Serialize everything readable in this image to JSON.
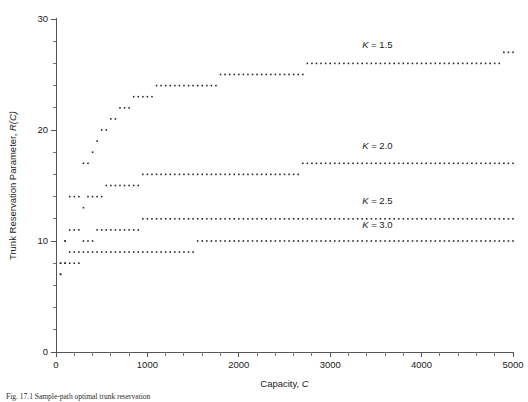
{
  "figure": {
    "caption": "Fig. 17.1  Sample-path optimal trunk reservation",
    "background": "#ffffff",
    "point_color": "#2a2a2a",
    "axis_color": "#555555"
  },
  "chart_data": {
    "type": "scatter",
    "title": "",
    "xlabel": "Capacity, C",
    "xlabel_plain": "Capacity,",
    "xlabel_italic": "C",
    "ylabel": "Trunk Reservation Parameter, R(C)",
    "ylabel_plain": "Trunk Reservation Parameter,",
    "ylabel_italic": "R(C)",
    "xlim": [
      0,
      5000
    ],
    "ylim": [
      0,
      30
    ],
    "x_major_ticks": [
      0,
      1000,
      2000,
      3000,
      4000,
      5000
    ],
    "x_major_tick_labels": [
      "0",
      "1000",
      "2000",
      "3000",
      "4000",
      "5000"
    ],
    "x_minor_step": 200,
    "y_major_ticks": [
      0,
      10,
      20,
      30
    ],
    "y_major_tick_labels": [
      "0",
      "10",
      "20",
      "30"
    ],
    "y_minor_step": 2,
    "grid": false,
    "legend_position": "inline-annotations",
    "series": [
      {
        "name": "K = 1.5",
        "label_plain": "K",
        "label_rest": " = 1.5",
        "annotation_x": 3350,
        "annotation_y": 27.4,
        "x": [
          50,
          100,
          150,
          200,
          250,
          300,
          350,
          400,
          450,
          500,
          550,
          600,
          650,
          700,
          750,
          800,
          850,
          900,
          950,
          1000,
          1050,
          1100,
          1150,
          1200,
          1250,
          1300,
          1350,
          1400,
          1450,
          1500,
          1550,
          1600,
          1650,
          1700,
          1750,
          1800,
          1850,
          1900,
          1950,
          2000,
          2050,
          2100,
          2150,
          2200,
          2250,
          2300,
          2350,
          2400,
          2450,
          2500,
          2550,
          2600,
          2650,
          2700,
          2750,
          2800,
          2850,
          2900,
          2950,
          3000,
          3050,
          3100,
          3150,
          3200,
          3250,
          3300,
          3350,
          3400,
          3450,
          3500,
          3550,
          3600,
          3650,
          3700,
          3750,
          3800,
          3850,
          3900,
          3950,
          4000,
          4050,
          4100,
          4150,
          4200,
          4250,
          4300,
          4350,
          4400,
          4450,
          4500,
          4550,
          4600,
          4650,
          4700,
          4750,
          4800,
          4850,
          4900,
          4950,
          5000
        ],
        "y": [
          7,
          10,
          14,
          14,
          14,
          17,
          17,
          18,
          19,
          20,
          20,
          21,
          21,
          22,
          22,
          22,
          23,
          23,
          23,
          23,
          23,
          24,
          24,
          24,
          24,
          24,
          24,
          24,
          24,
          24,
          24,
          24,
          24,
          24,
          24,
          25,
          25,
          25,
          25,
          25,
          25,
          25,
          25,
          25,
          25,
          25,
          25,
          25,
          25,
          25,
          25,
          25,
          25,
          25,
          26,
          26,
          26,
          26,
          26,
          26,
          26,
          26,
          26,
          26,
          26,
          26,
          26,
          26,
          26,
          26,
          26,
          26,
          26,
          26,
          26,
          26,
          26,
          26,
          26,
          26,
          26,
          26,
          26,
          26,
          26,
          26,
          26,
          26,
          26,
          26,
          26,
          26,
          26,
          26,
          26,
          26,
          26,
          27,
          27,
          27
        ]
      },
      {
        "name": "K = 2.0",
        "label_plain": "K",
        "label_rest": " = 2.0",
        "annotation_x": 3350,
        "annotation_y": 18.3,
        "x": [
          50,
          100,
          150,
          200,
          250,
          300,
          350,
          400,
          450,
          500,
          550,
          600,
          650,
          700,
          750,
          800,
          850,
          900,
          950,
          1000,
          1050,
          1100,
          1150,
          1200,
          1250,
          1300,
          1350,
          1400,
          1450,
          1500,
          1550,
          1600,
          1650,
          1700,
          1750,
          1800,
          1850,
          1900,
          1950,
          2000,
          2050,
          2100,
          2150,
          2200,
          2250,
          2300,
          2350,
          2400,
          2450,
          2500,
          2550,
          2600,
          2650,
          2700,
          2750,
          2800,
          2850,
          2900,
          2950,
          3000,
          3050,
          3100,
          3150,
          3200,
          3250,
          3300,
          3350,
          3400,
          3450,
          3500,
          3550,
          3600,
          3650,
          3700,
          3750,
          3800,
          3850,
          3900,
          3950,
          4000,
          4050,
          4100,
          4150,
          4200,
          4250,
          4300,
          4350,
          4400,
          4450,
          4500,
          4550,
          4600,
          4650,
          4700,
          4750,
          4800,
          4850,
          4900,
          4950,
          5000
        ],
        "y": [
          8,
          10,
          11,
          11,
          11,
          13,
          14,
          14,
          14,
          14,
          15,
          15,
          15,
          15,
          15,
          15,
          15,
          15,
          16,
          16,
          16,
          16,
          16,
          16,
          16,
          16,
          16,
          16,
          16,
          16,
          16,
          16,
          16,
          16,
          16,
          16,
          16,
          16,
          16,
          16,
          16,
          16,
          16,
          16,
          16,
          16,
          16,
          16,
          16,
          16,
          16,
          16,
          16,
          17,
          17,
          17,
          17,
          17,
          17,
          17,
          17,
          17,
          17,
          17,
          17,
          17,
          17,
          17,
          17,
          17,
          17,
          17,
          17,
          17,
          17,
          17,
          17,
          17,
          17,
          17,
          17,
          17,
          17,
          17,
          17,
          17,
          17,
          17,
          17,
          17,
          17,
          17,
          17,
          17,
          17,
          17,
          17,
          17,
          17,
          17
        ]
      },
      {
        "name": "K = 2.5",
        "label_plain": "K",
        "label_rest": " = 2.5",
        "annotation_x": 3350,
        "annotation_y": 13.3,
        "x": [
          50,
          100,
          150,
          200,
          250,
          300,
          350,
          400,
          450,
          500,
          550,
          600,
          650,
          700,
          750,
          800,
          850,
          900,
          950,
          1000,
          1050,
          1100,
          1150,
          1200,
          1250,
          1300,
          1350,
          1400,
          1450,
          1500,
          1550,
          1600,
          1650,
          1700,
          1750,
          1800,
          1850,
          1900,
          1950,
          2000,
          2050,
          2100,
          2150,
          2200,
          2250,
          2300,
          2350,
          2400,
          2450,
          2500,
          2550,
          2600,
          2650,
          2700,
          2750,
          2800,
          2850,
          2900,
          2950,
          3000,
          3050,
          3100,
          3150,
          3200,
          3250,
          3300,
          3350,
          3400,
          3450,
          3500,
          3550,
          3600,
          3650,
          3700,
          3750,
          3800,
          3850,
          3900,
          3950,
          4000,
          4050,
          4100,
          4150,
          4200,
          4250,
          4300,
          4350,
          4400,
          4450,
          4500,
          4550,
          4600,
          4650,
          4700,
          4750,
          4800,
          4850,
          4900,
          4950,
          5000
        ],
        "y": [
          8,
          8,
          9,
          9,
          9,
          10,
          10,
          10,
          11,
          11,
          11,
          11,
          11,
          11,
          11,
          11,
          11,
          11,
          12,
          12,
          12,
          12,
          12,
          12,
          12,
          12,
          12,
          12,
          12,
          12,
          12,
          12,
          12,
          12,
          12,
          12,
          12,
          12,
          12,
          12,
          12,
          12,
          12,
          12,
          12,
          12,
          12,
          12,
          12,
          12,
          12,
          12,
          12,
          12,
          12,
          12,
          12,
          12,
          12,
          12,
          12,
          12,
          12,
          12,
          12,
          12,
          12,
          12,
          12,
          12,
          12,
          12,
          12,
          12,
          12,
          12,
          12,
          12,
          12,
          12,
          12,
          12,
          12,
          12,
          12,
          12,
          12,
          12,
          12,
          12,
          12,
          12,
          12,
          12,
          12,
          12,
          12,
          12,
          12,
          12
        ]
      },
      {
        "name": "K = 3.0",
        "label_plain": "K",
        "label_rest": " = 3.0",
        "annotation_x": 3350,
        "annotation_y": 11.2,
        "x": [
          50,
          100,
          150,
          200,
          250,
          300,
          350,
          400,
          450,
          500,
          550,
          600,
          650,
          700,
          750,
          800,
          850,
          900,
          950,
          1000,
          1050,
          1100,
          1150,
          1200,
          1250,
          1300,
          1350,
          1400,
          1450,
          1500,
          1550,
          1600,
          1650,
          1700,
          1750,
          1800,
          1850,
          1900,
          1950,
          2000,
          2050,
          2100,
          2150,
          2200,
          2250,
          2300,
          2350,
          2400,
          2450,
          2500,
          2550,
          2600,
          2650,
          2700,
          2750,
          2800,
          2850,
          2900,
          2950,
          3000,
          3050,
          3100,
          3150,
          3200,
          3250,
          3300,
          3350,
          3400,
          3450,
          3500,
          3550,
          3600,
          3650,
          3700,
          3750,
          3800,
          3850,
          3900,
          3950,
          4000,
          4050,
          4100,
          4150,
          4200,
          4250,
          4300,
          4350,
          4400,
          4450,
          4500,
          4550,
          4600,
          4650,
          4700,
          4750,
          4800,
          4850,
          4900,
          4950,
          5000
        ],
        "y": [
          7,
          8,
          8,
          8,
          8,
          9,
          9,
          9,
          9,
          9,
          9,
          9,
          9,
          9,
          9,
          9,
          9,
          9,
          9,
          9,
          9,
          9,
          9,
          9,
          9,
          9,
          9,
          9,
          9,
          9,
          10,
          10,
          10,
          10,
          10,
          10,
          10,
          10,
          10,
          10,
          10,
          10,
          10,
          10,
          10,
          10,
          10,
          10,
          10,
          10,
          10,
          10,
          10,
          10,
          10,
          10,
          10,
          10,
          10,
          10,
          10,
          10,
          10,
          10,
          10,
          10,
          10,
          10,
          10,
          10,
          10,
          10,
          10,
          10,
          10,
          10,
          10,
          10,
          10,
          10,
          10,
          10,
          10,
          10,
          10,
          10,
          10,
          10,
          10,
          10,
          10,
          10,
          10,
          10,
          10,
          10,
          10,
          10,
          10,
          10
        ]
      }
    ]
  }
}
